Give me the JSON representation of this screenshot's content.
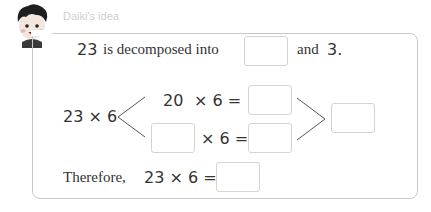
{
  "header": {
    "title": "Daiki's idea",
    "avatar_icon": "boy-avatar-icon"
  },
  "line1": {
    "number": "23",
    "text": "is decomposed into",
    "answer": "",
    "after": "and",
    "second_part": "3."
  },
  "diagram": {
    "left_expr": "23 × 6",
    "top_number": "20",
    "top_op": "× 6 =",
    "top_answer": "",
    "bottom_answer_left": "",
    "bottom_op": "× 6 =",
    "bottom_answer": "",
    "total_answer": ""
  },
  "conclusion": {
    "label": "Therefore,",
    "expr": "23 × 6 =",
    "answer": ""
  },
  "colors": {
    "border": "#c8c8c8",
    "title": "#cfcfcf",
    "text": "#333333"
  }
}
